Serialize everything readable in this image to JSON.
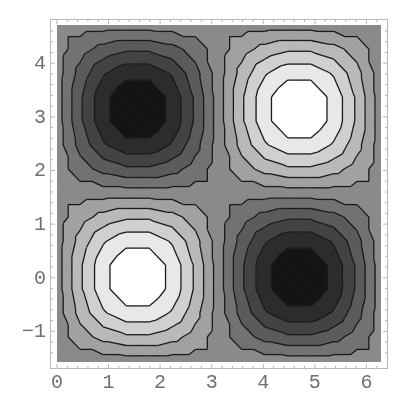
{
  "chart_data": {
    "type": "contour",
    "title": "",
    "xlabel": "",
    "ylabel": "",
    "function": "sin(x)*cos(y)",
    "xlim": [
      0,
      6.283185307
    ],
    "ylim": [
      -1.570796327,
      4.71238898
    ],
    "x_ticks": [
      0,
      1,
      2,
      3,
      4,
      5,
      6
    ],
    "x_tick_labels": [
      "0",
      "1",
      "2",
      "3",
      "4",
      "5",
      "6"
    ],
    "y_ticks": [
      -1,
      0,
      1,
      2,
      3,
      4
    ],
    "y_tick_labels": [
      "−1",
      "0",
      "1",
      "2",
      "3",
      "4"
    ],
    "z_range": [
      -1,
      1
    ],
    "num_contours": 10,
    "contour_levels": [
      -0.818,
      -0.636,
      -0.455,
      -0.273,
      -0.091,
      0.091,
      0.273,
      0.455,
      0.636,
      0.818
    ],
    "plot_points": 15,
    "extrema": [
      {
        "x": 1.571,
        "y": 0.0,
        "z": 1,
        "kind": "max"
      },
      {
        "x": 4.712,
        "y": 3.142,
        "z": 1,
        "kind": "max"
      },
      {
        "x": 1.571,
        "y": 3.142,
        "z": -1,
        "kind": "min"
      },
      {
        "x": 4.712,
        "y": 0.0,
        "z": -1,
        "kind": "min"
      }
    ],
    "shading": "grayscale, dark = low, white = high",
    "grid": false,
    "legend": "none"
  },
  "style": {
    "line_color": "#1a1a1a",
    "frame_color": "#b8b8b8",
    "label_color": "#707070",
    "low_color": "#141414",
    "high_color": "#ffffff"
  }
}
